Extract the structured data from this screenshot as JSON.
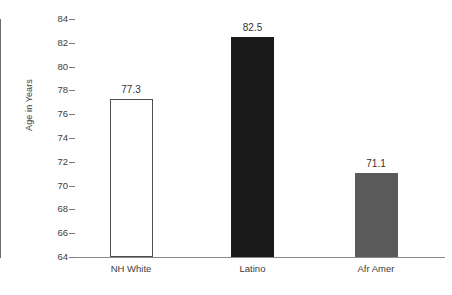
{
  "chart_data": {
    "type": "bar",
    "title": "",
    "xlabel": "",
    "ylabel": "Age in Years",
    "categories": [
      "NH White",
      "Latino",
      "Afr Amer"
    ],
    "values": [
      77.3,
      82.5,
      71.1
    ],
    "value_labels": [
      "77.3",
      "82.5",
      "71.1"
    ],
    "ylim": [
      64,
      84
    ],
    "ytick_step": 2,
    "yticks": [
      64,
      66,
      68,
      70,
      72,
      74,
      76,
      78,
      80,
      82,
      84
    ],
    "ytick_labels": [
      "64",
      "66",
      "68",
      "70",
      "72",
      "74",
      "76",
      "78",
      "80",
      "82",
      "84"
    ],
    "grid": false,
    "legend": "none",
    "bar_colors": [
      "#ffffff",
      "#1a1a1a",
      "#5a5a5a"
    ],
    "bar_edge_colors": [
      "#4d4d4d",
      "#1a1a1a",
      "#5a5a5a"
    ],
    "axis_color": "#7a7a7a",
    "text_color": "#3d3d3d"
  },
  "axis": {
    "y_title": "Age in Years"
  }
}
